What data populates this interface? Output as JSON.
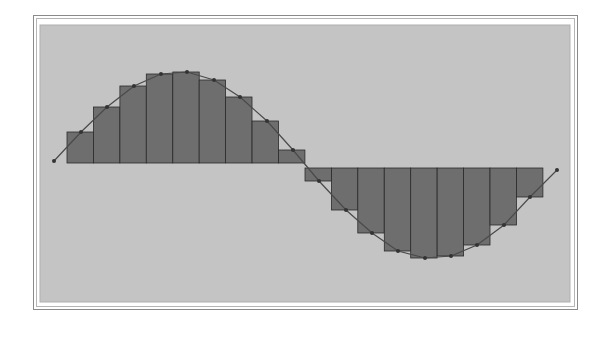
{
  "chart_data": {
    "type": "bar",
    "subtype": "riemann-sum-with-curve",
    "title": "",
    "xlabel": "",
    "ylabel": "",
    "grid": false,
    "legend": null,
    "colors": {
      "plot_background": "#c4c4c4",
      "bar_fill": "#6e6e6e",
      "bar_stroke": "#2a2a2a",
      "curve": "#4a4a4a",
      "frame": "#8a8a8a"
    },
    "curve": {
      "function": "sine",
      "period_count": 1,
      "points_px": [
        [
          54,
          161
        ],
        [
          81,
          132
        ],
        [
          107,
          107
        ],
        [
          134,
          86
        ],
        [
          161,
          74
        ],
        [
          187,
          72
        ],
        [
          214,
          80
        ],
        [
          240,
          97
        ],
        [
          267,
          121
        ],
        [
          293,
          150
        ],
        [
          319,
          181
        ],
        [
          346,
          210
        ],
        [
          372,
          233
        ],
        [
          398,
          251
        ],
        [
          425,
          258
        ],
        [
          451,
          256
        ],
        [
          477,
          245
        ],
        [
          504,
          225
        ],
        [
          530,
          197
        ],
        [
          557,
          170
        ]
      ]
    },
    "categories": [
      "1",
      "2",
      "3",
      "4",
      "5",
      "6",
      "7",
      "8",
      "9",
      "10",
      "11",
      "12",
      "13",
      "14",
      "15",
      "16",
      "17",
      "18"
    ],
    "values": [
      0.34,
      0.63,
      0.87,
      1.0,
      1.02,
      0.94,
      0.74,
      0.47,
      0.15,
      -0.15,
      -0.47,
      -0.74,
      -0.94,
      -1.02,
      -1.0,
      -0.87,
      -0.63,
      -0.34
    ],
    "ylim": [
      -1.1,
      1.1
    ],
    "layout": {
      "plot_left": 40,
      "plot_top": 25,
      "plot_right": 570,
      "plot_bottom": 302,
      "baseline_y": 165,
      "bar_start_x": 67,
      "bar_width": 26.44,
      "bar_tops_px": [
        132,
        107,
        86,
        74,
        72,
        80,
        97,
        121,
        150,
        181,
        210,
        233,
        251,
        258,
        256,
        245,
        225,
        197
      ]
    }
  }
}
